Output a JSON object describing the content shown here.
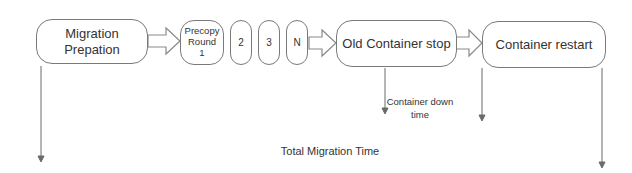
{
  "diagram": {
    "steps": [
      {
        "id": "migration-preparation",
        "label": "Migration\nPrepation"
      },
      {
        "id": "precopy-round-1",
        "label": "Precopy\nRound\n1"
      },
      {
        "id": "precopy-round-2",
        "label": "2"
      },
      {
        "id": "precopy-round-3",
        "label": "3"
      },
      {
        "id": "precopy-round-n",
        "label": "N"
      },
      {
        "id": "old-container-stop",
        "label": "Old Container stop"
      },
      {
        "id": "container-restart",
        "label": "Container restart"
      }
    ],
    "intervals": {
      "downtime": {
        "label": "Container down\ntime",
        "from": "old-container-stop",
        "to": "container-restart"
      },
      "total": {
        "label": "Total Migration Time",
        "from": "migration-preparation",
        "to": "container-restart"
      }
    },
    "colors": {
      "stroke": "#7a7a7a",
      "text": "#333333",
      "background": "#ffffff"
    }
  }
}
